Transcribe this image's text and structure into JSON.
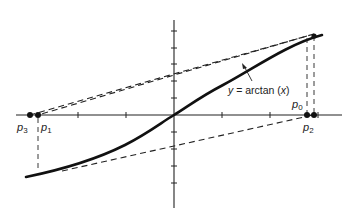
{
  "diagram": {
    "title": "",
    "function_label": {
      "prefix": "y",
      "equals": " = arctan (",
      "var": "x",
      "suffix": ")"
    },
    "points": [
      {
        "id": "p0",
        "base": "p",
        "sub": "0"
      },
      {
        "id": "p1",
        "base": "p",
        "sub": "1"
      },
      {
        "id": "p2",
        "base": "p",
        "sub": "2"
      },
      {
        "id": "p3",
        "base": "p",
        "sub": "3"
      }
    ],
    "colors": {
      "ink": "#222222",
      "curve": "#111111",
      "background": "#ffffff"
    }
  }
}
